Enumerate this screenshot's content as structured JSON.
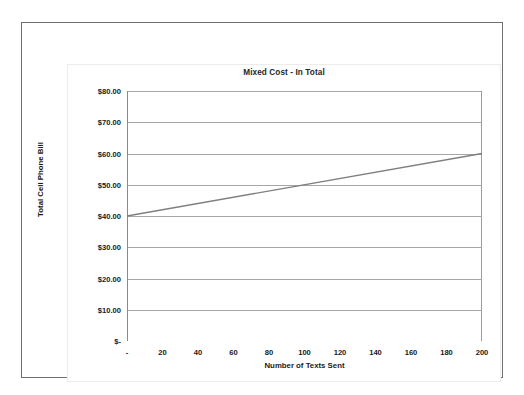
{
  "page": {
    "background_color": "#ffffff",
    "frame_color": "#6f6f6f"
  },
  "chart_data": {
    "type": "line",
    "title": "Mixed Cost - In Total",
    "xlabel": "Number of Texts Sent",
    "ylabel": "Total Cell Phone Bill",
    "x": [
      0,
      200
    ],
    "values": [
      40.0,
      60.0
    ],
    "series": [
      {
        "name": "Total Cell Phone Bill",
        "x": [
          0,
          200
        ],
        "values": [
          40.0,
          60.0
        ],
        "color": "#7f7f7f"
      }
    ],
    "xlim": [
      0,
      200
    ],
    "ylim": [
      0,
      80
    ],
    "x_tick_labels": [
      "-",
      "20",
      "40",
      "60",
      "80",
      "100",
      "120",
      "140",
      "160",
      "180",
      "200"
    ],
    "x_tick_values": [
      0,
      20,
      40,
      60,
      80,
      100,
      120,
      140,
      160,
      180,
      200
    ],
    "y_tick_labels": [
      "$80.00",
      "$70.00",
      "$60.00",
      "$50.00",
      "$40.00",
      "$30.00",
      "$20.00",
      "$10.00",
      "$-"
    ],
    "y_tick_values": [
      80,
      70,
      60,
      50,
      40,
      30,
      20,
      10,
      0
    ],
    "grid": "horizontal",
    "legend": "none",
    "gridline_color": "#a6a6a6",
    "axis_color": "#8a8a8a",
    "fixed_cost": 40.0,
    "variable_rate_per_text": 0.1
  }
}
